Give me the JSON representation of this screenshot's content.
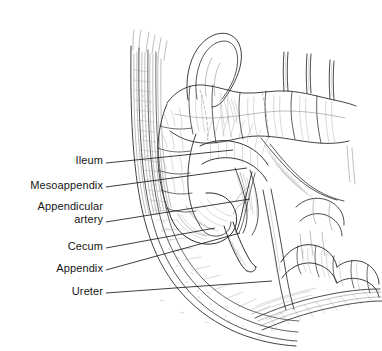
{
  "figure": {
    "background_color": "#ffffff",
    "ink_color": "#2b2b2b",
    "label_color": "#161616",
    "width": 382,
    "height": 351,
    "style": "black-and-white line engraving / pen-and-ink medical illustration"
  },
  "labels": [
    {
      "id": "ileum",
      "lines": [
        "Ileum"
      ],
      "text_right_x": 103,
      "text_baseline_y": 163,
      "leader": {
        "x1": 106,
        "y1": 163,
        "x2": 233,
        "y2": 150
      }
    },
    {
      "id": "mesoappendix",
      "lines": [
        "Mesoappendix"
      ],
      "text_right_x": 103,
      "text_baseline_y": 188,
      "leader": {
        "x1": 106,
        "y1": 187,
        "x2": 247,
        "y2": 168
      }
    },
    {
      "id": "appendicular-artery",
      "lines": [
        "Appendicular",
        "artery"
      ],
      "text_right_x": 103,
      "text_baseline_y": 222,
      "leader": {
        "x1": 106,
        "y1": 222,
        "x2": 250,
        "y2": 199
      }
    },
    {
      "id": "cecum",
      "lines": [
        "Cecum"
      ],
      "text_right_x": 103,
      "text_baseline_y": 249,
      "leader": {
        "x1": 106,
        "y1": 248,
        "x2": 215,
        "y2": 228
      }
    },
    {
      "id": "appendix",
      "lines": [
        "Appendix"
      ],
      "text_right_x": 103,
      "text_baseline_y": 271,
      "leader": {
        "x1": 106,
        "y1": 270,
        "x2": 240,
        "y2": 233
      }
    },
    {
      "id": "ureter",
      "lines": [
        "Ureter"
      ],
      "text_right_x": 103,
      "text_baseline_y": 294,
      "leader": {
        "x1": 106,
        "y1": 293,
        "x2": 272,
        "y2": 281
      }
    }
  ],
  "structures": [
    {
      "id": "transverse-colon",
      "name": "Transverse colon with haustra"
    },
    {
      "id": "ascending-colon",
      "name": "Ascending colon"
    },
    {
      "id": "cecum-sac",
      "name": "Cecum"
    },
    {
      "id": "appendix-tube",
      "name": "Vermiform appendix"
    },
    {
      "id": "mesoappendix-fold",
      "name": "Mesoappendix"
    },
    {
      "id": "appendicular-artery-vessel",
      "name": "Appendicular artery"
    },
    {
      "id": "terminal-ileum",
      "name": "Terminal ileum"
    },
    {
      "id": "small-bowel-loops",
      "name": "Small bowel loops"
    },
    {
      "id": "abdominal-wall",
      "name": "Layered abdominal wall with fatty peritoneal layer"
    },
    {
      "id": "iliacus-psoas",
      "name": "Iliacus and psoas muscle hatching"
    },
    {
      "id": "ureter-tube",
      "name": "Ureter"
    },
    {
      "id": "retractor-tines",
      "name": "Retractor tines / cut fascial strips"
    }
  ]
}
